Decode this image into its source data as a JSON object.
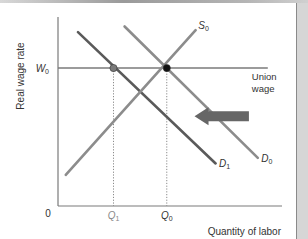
{
  "chart_data": {
    "type": "line",
    "title": "",
    "xlabel": "Quantity of labor",
    "ylabel": "Real wage rate",
    "origin_label": "0",
    "xlim": [
      0,
      10
    ],
    "ylim": [
      0,
      10
    ],
    "x_ticks": [
      {
        "label": "Q",
        "sub": "1",
        "value": 2.5
      },
      {
        "label": "Q",
        "sub": "0",
        "value": 4.9
      }
    ],
    "y_ticks": [
      {
        "label": "W",
        "sub": "0",
        "value": 7.3
      }
    ],
    "series": [
      {
        "name": "D1",
        "label": "D",
        "sub": "1",
        "kind": "demand",
        "color": "#5a5a5a",
        "points": [
          [
            0.9,
            9.2
          ],
          [
            7.1,
            2.25
          ]
        ]
      },
      {
        "name": "D0",
        "label": "D",
        "sub": "0",
        "kind": "demand",
        "color": "#8c8c8c",
        "points": [
          [
            3.0,
            9.5
          ],
          [
            9.0,
            2.55
          ]
        ]
      },
      {
        "name": "S0",
        "label": "S",
        "sub": "0",
        "kind": "supply",
        "color": "#8c8c8c",
        "points": [
          [
            0.35,
            1.65
          ],
          [
            6.2,
            9.3
          ]
        ]
      }
    ],
    "horizontal_lines": [
      {
        "name": "union-wage",
        "label_lines": [
          "Union",
          "wage"
        ],
        "y": 7.3,
        "x_from": 0,
        "x_to": 9.45,
        "color": "#7a7a7a"
      }
    ],
    "points": [
      {
        "name": "W0-D1",
        "x": 2.5,
        "y": 7.3,
        "color": "#7a7a7a"
      },
      {
        "name": "W0-D0",
        "x": 4.9,
        "y": 7.3,
        "color": "#111111"
      }
    ],
    "guides": [
      {
        "name": "Q1-guide",
        "x": 2.5,
        "y": 7.3
      },
      {
        "name": "Q0-guide",
        "x": 4.9,
        "y": 7.3
      }
    ],
    "annotations": [
      {
        "name": "demand-shift-arrow",
        "type": "arrow",
        "direction": "left",
        "from": [
          8.6,
          4.75
        ],
        "to": [
          6.15,
          4.75
        ],
        "color": "#666666"
      }
    ],
    "grid": false,
    "legend": "none"
  }
}
